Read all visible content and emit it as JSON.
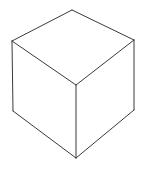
{
  "figure": {
    "type": "line-drawing",
    "projection": "isometric-oblique",
    "canvas": {
      "width": 142,
      "height": 170,
      "background_color": "#ffffff"
    },
    "style": {
      "line_color": "#3a3a3a",
      "line_width": 1,
      "face_fill": "#ffffff",
      "shading": "none",
      "hidden_lines": "not shown"
    },
    "vertices": {
      "top_back": {
        "label": "top-back apex",
        "x": 72,
        "y": 10
      },
      "top_left": {
        "label": "top-left",
        "x": 12,
        "y": 41
      },
      "top_right": {
        "label": "top-right",
        "x": 134,
        "y": 40
      },
      "top_front": {
        "label": "top-front center",
        "x": 76,
        "y": 85
      },
      "bottom_left": {
        "label": "bottom-left",
        "x": 13,
        "y": 111
      },
      "bottom_right": {
        "label": "bottom-right",
        "x": 134,
        "y": 110
      },
      "bottom_front": {
        "label": "bottom-front center",
        "x": 76,
        "y": 158
      }
    },
    "faces": {
      "top": {
        "name": "top face",
        "points": "72,10 134,40 76,85 12,41"
      },
      "left": {
        "name": "front-left face",
        "points": "12,41 76,85 76,158 13,111"
      },
      "right": {
        "name": "front-right face",
        "points": "76,85 134,40 134,110 76,158"
      }
    },
    "edges": [
      {
        "name": "top-back-to-top-left",
        "d": "M 72 10 L 12 41"
      },
      {
        "name": "top-back-to-top-right",
        "d": "M 72 10 L 134 40"
      },
      {
        "name": "top-left-to-top-front",
        "d": "M 12 41 L 76 85"
      },
      {
        "name": "top-right-to-top-front",
        "d": "M 134 40 L 76 85"
      },
      {
        "name": "left-vertical",
        "d": "M 12 41 L 13 111"
      },
      {
        "name": "right-vertical",
        "d": "M 134 40 L 134 110"
      },
      {
        "name": "center-vertical",
        "d": "M 76 85 L 76 158"
      },
      {
        "name": "bottom-left-to-bottom-front",
        "d": "M 13 111 L 76 158"
      },
      {
        "name": "bottom-right-to-bottom-front",
        "d": "M 134 110 L 76 158"
      }
    ]
  }
}
